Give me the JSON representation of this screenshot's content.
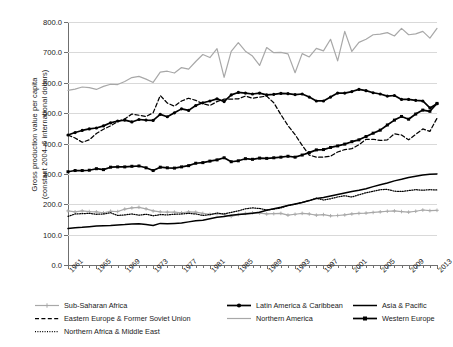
{
  "chart_data": {
    "type": "line",
    "title": "",
    "xlabel": "",
    "ylabel": "Gross production value per capita\n(constant 2004–6 international dollars)",
    "ylim": [
      0,
      800
    ],
    "ytick_labels": [
      "0.0",
      "100.0",
      "200.0",
      "300.0",
      "400.0",
      "500.0",
      "600.0",
      "700.0",
      "800.0"
    ],
    "ytick_values": [
      0,
      100,
      200,
      300,
      400,
      500,
      600,
      700,
      800
    ],
    "xlim": [
      1961,
      2013
    ],
    "xtick_labels": [
      "1961",
      "1965",
      "1969",
      "1973",
      "1977",
      "1981",
      "1985",
      "1989",
      "1993",
      "1997",
      "2001",
      "2005",
      "2009",
      "2013"
    ],
    "xtick_values": [
      1961,
      1965,
      1969,
      1973,
      1977,
      1981,
      1985,
      1989,
      1993,
      1997,
      2001,
      2005,
      2009,
      2013
    ],
    "xtick_minor_step": 1,
    "grid": "horizontal",
    "legend_position": "bottom",
    "x": [
      1961,
      1962,
      1963,
      1964,
      1965,
      1966,
      1967,
      1968,
      1969,
      1970,
      1971,
      1972,
      1973,
      1974,
      1975,
      1976,
      1977,
      1978,
      1979,
      1980,
      1981,
      1982,
      1983,
      1984,
      1985,
      1986,
      1987,
      1988,
      1989,
      1990,
      1991,
      1992,
      1993,
      1994,
      1995,
      1996,
      1997,
      1998,
      1999,
      2000,
      2001,
      2002,
      2003,
      2004,
      2005,
      2006,
      2007,
      2008,
      2009,
      2010,
      2011,
      2012,
      2013
    ],
    "series": [
      {
        "name": "Sub-Saharan Africa",
        "style": "solid-light-marker",
        "color": "#a8a8a8",
        "values": [
          178,
          175,
          178,
          176,
          175,
          172,
          177,
          176,
          184,
          188,
          190,
          185,
          178,
          175,
          174,
          174,
          172,
          175,
          174,
          170,
          167,
          169,
          166,
          160,
          166,
          170,
          172,
          171,
          168,
          169,
          170,
          164,
          167,
          170,
          168,
          164,
          166,
          162,
          163,
          165,
          168,
          170,
          171,
          173,
          175,
          177,
          178,
          176,
          174,
          177,
          181,
          179,
          180
        ]
      },
      {
        "name": "Eastern Europe & Former Soviet Union",
        "style": "dashed",
        "color": "#000000",
        "values": [
          428,
          418,
          404,
          412,
          433,
          447,
          458,
          472,
          481,
          497,
          493,
          489,
          501,
          558,
          533,
          523,
          540,
          549,
          542,
          531,
          525,
          538,
          546,
          546,
          547,
          556,
          549,
          553,
          556,
          534,
          495,
          459,
          429,
          394,
          362,
          355,
          355,
          358,
          372,
          380,
          383,
          396,
          414,
          414,
          410,
          412,
          432,
          428,
          412,
          430,
          448,
          440,
          483
        ]
      },
      {
        "name": "Northern Africa & Middle East",
        "style": "dotted",
        "color": "#000000",
        "values": [
          160,
          168,
          169,
          170,
          167,
          168,
          172,
          163,
          165,
          168,
          164,
          167,
          162,
          166,
          165,
          167,
          168,
          170,
          168,
          163,
          166,
          171,
          168,
          173,
          178,
          185,
          188,
          186,
          181,
          184,
          188,
          196,
          200,
          206,
          212,
          220,
          214,
          218,
          224,
          228,
          224,
          231,
          238,
          243,
          248,
          249,
          243,
          242,
          245,
          248,
          246,
          248,
          247
        ]
      },
      {
        "name": "Latin America & Caribbean",
        "style": "solid-marker",
        "color": "#000000",
        "values": [
          428,
          436,
          443,
          448,
          451,
          458,
          468,
          474,
          477,
          471,
          479,
          477,
          476,
          496,
          488,
          501,
          514,
          509,
          525,
          534,
          540,
          547,
          538,
          560,
          568,
          566,
          563,
          566,
          560,
          562,
          565,
          564,
          561,
          563,
          553,
          540,
          540,
          553,
          566,
          566,
          571,
          578,
          574,
          567,
          563,
          556,
          558,
          545,
          545,
          542,
          540,
          517,
          531
        ]
      },
      {
        "name": "Northern America",
        "style": "solid-light",
        "color": "#a8a8a8",
        "values": [
          575,
          579,
          586,
          584,
          578,
          588,
          595,
          594,
          604,
          617,
          621,
          612,
          601,
          635,
          638,
          632,
          650,
          645,
          670,
          693,
          683,
          712,
          618,
          703,
          732,
          704,
          688,
          657,
          716,
          699,
          700,
          695,
          633,
          696,
          685,
          713,
          705,
          743,
          672,
          769,
          703,
          733,
          743,
          758,
          760,
          765,
          754,
          779,
          758,
          761,
          769,
          747,
          779
        ]
      },
      {
        "name": "Asia & Pacific",
        "style": "solid-thin",
        "color": "#000000",
        "values": [
          120,
          123,
          124,
          126,
          128,
          129,
          130,
          132,
          133,
          135,
          136,
          133,
          130,
          137,
          136,
          137,
          138,
          142,
          146,
          147,
          152,
          157,
          160,
          164,
          166,
          168,
          170,
          174,
          180,
          185,
          190,
          196,
          201,
          206,
          212,
          219,
          222,
          227,
          232,
          237,
          242,
          246,
          251,
          258,
          264,
          270,
          277,
          282,
          288,
          292,
          296,
          299,
          300
        ]
      },
      {
        "name": "Western Europe",
        "style": "solid-marker-sq",
        "color": "#000000",
        "values": [
          307,
          311,
          311,
          312,
          317,
          314,
          322,
          323,
          323,
          325,
          326,
          320,
          311,
          322,
          320,
          319,
          323,
          327,
          335,
          337,
          342,
          346,
          353,
          340,
          343,
          350,
          348,
          352,
          351,
          353,
          355,
          358,
          355,
          362,
          370,
          379,
          380,
          387,
          392,
          398,
          406,
          412,
          423,
          434,
          444,
          461,
          477,
          489,
          480,
          497,
          510,
          506,
          532
        ]
      }
    ]
  },
  "legend": {
    "items": [
      {
        "label": "Sub-Saharan Africa",
        "style": "solid-light-marker",
        "col": 0,
        "row": 0
      },
      {
        "label": "Latin America & Caribbean",
        "style": "solid-marker",
        "col": 1,
        "row": 0
      },
      {
        "label": "Asia & Pacific",
        "style": "solid-thin",
        "col": 2,
        "row": 0
      },
      {
        "label": "Eastern Europe & Former Soviet Union",
        "style": "dashed",
        "col": 0,
        "row": 1
      },
      {
        "label": "Northern America",
        "style": "solid-light",
        "col": 1,
        "row": 1
      },
      {
        "label": "Western Europe",
        "style": "solid-marker-sq",
        "col": 2,
        "row": 1
      },
      {
        "label": "Northern Africa & Middle East",
        "style": "dotted",
        "col": 0,
        "row": 2
      }
    ]
  },
  "colors": {
    "grid": "#d9d9d9",
    "axis": "#6f6f6f",
    "dark": "#000000",
    "light": "#a8a8a8"
  }
}
